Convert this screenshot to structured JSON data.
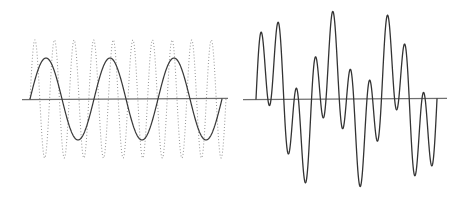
{
  "figure": {
    "background_color": "#ffffff",
    "width": 464,
    "height": 203,
    "caption": ""
  },
  "chart_data": {
    "type": "line",
    "title": "",
    "xlabel": "",
    "ylabel": "",
    "grid": false,
    "legend": "none",
    "panels": [
      {
        "name": "component-waves",
        "label": "Component waves",
        "axis": {
          "zero_line_y": 99,
          "x_start": 22,
          "x_end": 228
        },
        "xlim": [
          0,
          1
        ],
        "ylim": [
          -1.15,
          1.15
        ],
        "series": [
          {
            "name": "envelope-wave",
            "label": "Low-frequency sine (solid)",
            "style": "solid",
            "color": "#3b3b3b",
            "amplitude": 41,
            "cycles": 3,
            "phase": 0,
            "x_start": 30,
            "x_end": 222
          },
          {
            "name": "carrier-wave",
            "label": "High-frequency sine (dotted)",
            "style": "dotted",
            "color": "#9a9a9a",
            "amplitude": 59,
            "cycles": 10,
            "phase": 0,
            "x_start": 30,
            "x_end": 226
          }
        ]
      },
      {
        "name": "superposition",
        "label": "Sum of the two waves",
        "axis": {
          "zero_line_y": 99,
          "x_start": 243,
          "x_end": 447
        },
        "xlim": [
          0,
          1
        ],
        "ylim": [
          -1.8,
          1.8
        ],
        "series": [
          {
            "name": "sum-wave",
            "label": "Superposition (beats)",
            "style": "solid",
            "color": "#333333",
            "amplitude_low": 41,
            "amplitude_high": 47,
            "cycles_low": 3,
            "cycles_high": 10,
            "x_start": 256,
            "x_end": 437
          }
        ]
      }
    ]
  }
}
